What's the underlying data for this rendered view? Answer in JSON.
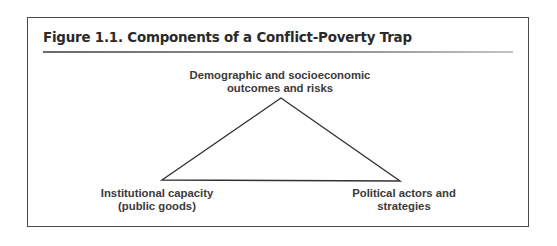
{
  "figure": {
    "title": "Figure 1.1.  Components of a Conflict-Poverty Trap",
    "nodes": {
      "top": {
        "line1": "Demographic and socioeconomic",
        "line2": "outcomes and risks"
      },
      "left": {
        "line1": "Institutional capacity",
        "line2": "(public goods)"
      },
      "right": {
        "line1": "Political actors and",
        "line2": "strategies"
      }
    },
    "shape": "triangle",
    "colors": {
      "border": "#4a4a4a",
      "text": "#3a3a3a",
      "line": "#333333"
    }
  }
}
